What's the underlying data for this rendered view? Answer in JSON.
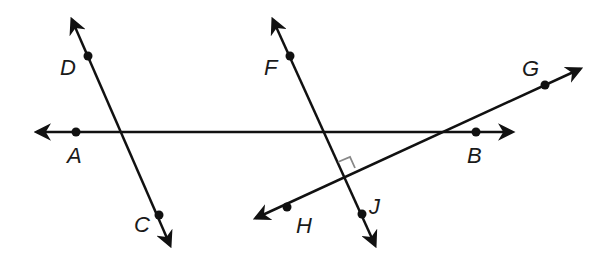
{
  "diagram": {
    "type": "geometry-lines",
    "lines": [
      {
        "name": "line-DC",
        "points": [
          "D",
          "C"
        ]
      },
      {
        "name": "line-AB",
        "points": [
          "A",
          "B"
        ]
      },
      {
        "name": "line-FJ",
        "points": [
          "F",
          "J"
        ]
      },
      {
        "name": "line-HG",
        "points": [
          "H",
          "G"
        ]
      }
    ],
    "points": {
      "A": {
        "label": "A"
      },
      "B": {
        "label": "B"
      },
      "C": {
        "label": "C"
      },
      "D": {
        "label": "D"
      },
      "F": {
        "label": "F"
      },
      "G": {
        "label": "G"
      },
      "H": {
        "label": "H"
      },
      "J": {
        "label": "J"
      }
    },
    "annotations": [
      {
        "type": "right-angle",
        "at": "intersection of FJ and HG"
      }
    ]
  }
}
